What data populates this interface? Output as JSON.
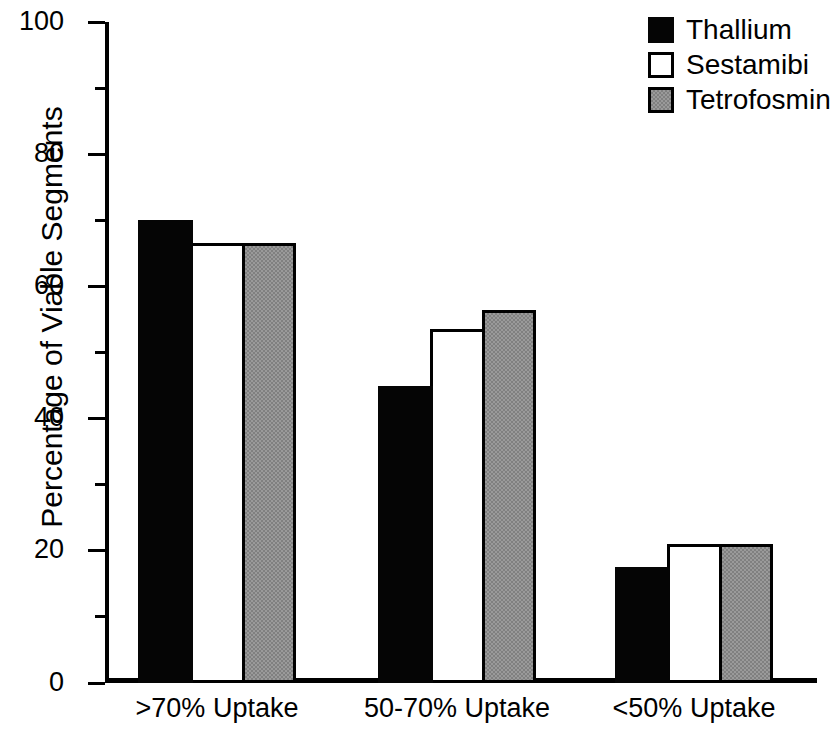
{
  "chart_data": {
    "type": "bar",
    "title": "",
    "xlabel": "",
    "ylabel": "Percentage of Viable Segments",
    "categories": [
      ">70% Uptake",
      "50-70% Uptake",
      "<50% Uptake"
    ],
    "series": [
      {
        "name": "Thallium",
        "color": "#050505",
        "values": [
          70.0,
          45.0,
          17.5
        ]
      },
      {
        "name": "Sestamibi",
        "color": "#ffffff",
        "values": [
          66.5,
          53.5,
          21.0
        ]
      },
      {
        "name": "Tetrofosmin",
        "color": "#9a9a9a",
        "values": [
          66.5,
          56.5,
          21.0
        ]
      }
    ],
    "ylim": [
      0,
      100
    ],
    "yticks": [
      0,
      20,
      40,
      60,
      80,
      100
    ],
    "ytick_labels": [
      "0",
      "20",
      "40",
      "60",
      "80",
      "100"
    ],
    "yminor_ticks": [
      10,
      30,
      50,
      70,
      90
    ],
    "grid": false,
    "legend_position": "top-right",
    "legend_entries": [
      "Thallium",
      "Sestamibi",
      "Tetrofosmin"
    ]
  }
}
